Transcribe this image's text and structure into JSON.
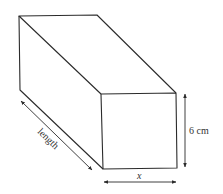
{
  "diagram": {
    "colors": {
      "stroke": "#2b2b2b",
      "text": "#333333",
      "background": "#ffffff"
    },
    "shape": {
      "type": "cuboid",
      "front_face": {
        "tl": [
          101,
          94
        ],
        "tr": [
          176,
          93
        ],
        "br": [
          177,
          168
        ],
        "bl": [
          103,
          169
        ]
      },
      "back_top_left": [
        19,
        16
      ],
      "back_top_right": [
        97,
        15
      ],
      "back_bottom_left": [
        20,
        90
      ]
    },
    "labels": {
      "height": "6 cm",
      "width": "x",
      "length": "length"
    },
    "dimensions": [
      {
        "name": "height",
        "label": "6 cm",
        "from": [
          185,
          93
        ],
        "to": [
          185,
          168
        ]
      },
      {
        "name": "width",
        "label": "x",
        "from": [
          103,
          182
        ],
        "to": [
          177,
          182
        ]
      },
      {
        "name": "length",
        "label": "length",
        "from": [
          21,
          101
        ],
        "to": [
          92,
          170
        ]
      }
    ]
  }
}
